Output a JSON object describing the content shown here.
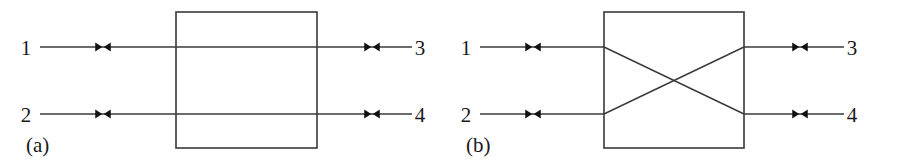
{
  "figure": {
    "background_color": "#ffffff",
    "line_color": "#3a3a3a",
    "arrow_color": "#111111",
    "text_color": "#1a1a1a",
    "width": 901,
    "height": 162
  },
  "subfigures": [
    {
      "id": "a",
      "caption": "(a)",
      "caption_x": 26,
      "caption_y": 152,
      "internal_connection": "through",
      "box": {
        "x": 176,
        "y": 12,
        "width": 141,
        "height": 136
      },
      "rows": [
        {
          "y": 47,
          "left_label": "1",
          "left_label_x": 26,
          "right_label": "3",
          "right_label_x": 420,
          "left_wire": {
            "x1": 40,
            "x2": 176
          },
          "right_wire": {
            "x1": 317,
            "x2": 412
          },
          "left_arrow_x": 103,
          "right_arrow_x": 372
        },
        {
          "y": 114,
          "left_label": "2",
          "left_label_x": 26,
          "right_label": "4",
          "right_label_x": 420,
          "left_wire": {
            "x1": 40,
            "x2": 176
          },
          "right_wire": {
            "x1": 317,
            "x2": 412
          },
          "left_arrow_x": 103,
          "right_arrow_x": 372
        }
      ],
      "internal_lines": [
        {
          "x1": 176,
          "y1": 47,
          "x2": 317,
          "y2": 47
        },
        {
          "x1": 176,
          "y1": 114,
          "x2": 317,
          "y2": 114
        }
      ]
    },
    {
      "id": "b",
      "caption": "(b)",
      "caption_x": 466,
      "caption_y": 152,
      "internal_connection": "crossed",
      "box": {
        "x": 604,
        "y": 12,
        "width": 140,
        "height": 136
      },
      "rows": [
        {
          "y": 47,
          "left_label": "1",
          "left_label_x": 466,
          "right_label": "3",
          "right_label_x": 852,
          "left_wire": {
            "x1": 480,
            "x2": 604
          },
          "right_wire": {
            "x1": 744,
            "x2": 844
          },
          "left_arrow_x": 533,
          "right_arrow_x": 800
        },
        {
          "y": 114,
          "left_label": "2",
          "left_label_x": 466,
          "right_label": "4",
          "right_label_x": 852,
          "left_wire": {
            "x1": 480,
            "x2": 604
          },
          "right_wire": {
            "x1": 744,
            "x2": 844
          },
          "left_arrow_x": 533,
          "right_arrow_x": 800
        }
      ],
      "internal_lines": [
        {
          "x1": 604,
          "y1": 47,
          "x2": 744,
          "y2": 114
        },
        {
          "x1": 604,
          "y1": 114,
          "x2": 744,
          "y2": 47
        }
      ]
    }
  ],
  "arrow_marker": {
    "name": "double-arrowhead-pair",
    "description": "right-pointing solid triangle followed by left-pointing solid triangle",
    "half_width": 7,
    "height": 9,
    "gap": 1.5
  }
}
